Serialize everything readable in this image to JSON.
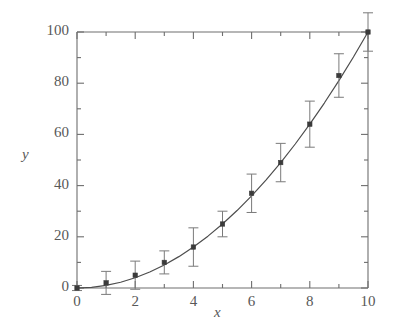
{
  "chart_data": {
    "type": "line",
    "title": "",
    "subtitle": "",
    "xlabel": "x",
    "ylabel": "y",
    "xlim": [
      0,
      10
    ],
    "ylim": [
      0,
      100
    ],
    "grid": false,
    "legend": null,
    "x_ticks": [
      0,
      2,
      4,
      6,
      8,
      10
    ],
    "x_tick_labels": [
      "0",
      "2",
      "4",
      "6",
      "8",
      "10"
    ],
    "x_minor_ticks": [
      1,
      3,
      5,
      7,
      9
    ],
    "y_ticks": [
      0,
      20,
      40,
      60,
      80,
      100
    ],
    "y_tick_labels": [
      "0",
      "20",
      "40",
      "60",
      "80",
      "100"
    ],
    "y_minor_ticks": [
      10,
      30,
      50,
      70,
      90
    ],
    "marker": "square",
    "line_style": "solid",
    "line_color": "#4d4d4d",
    "marker_color": "#3b3b3b",
    "errorbar_color": "#7a7a7a",
    "axis_color": "#6e6e6e",
    "series": [
      {
        "name": "y = x^2",
        "x": [
          0,
          1,
          2,
          3,
          4,
          5,
          6,
          7,
          8,
          9,
          10
        ],
        "values": [
          0,
          2,
          5,
          10,
          16,
          25,
          37,
          49,
          64,
          83,
          100
        ],
        "yerr": [
          1,
          4.5,
          5.5,
          4.5,
          7.5,
          5,
          7.5,
          7.5,
          9,
          8.5,
          7.5
        ]
      }
    ],
    "curve": {
      "description": "smooth quadratic fit through data points",
      "x": [
        0,
        0.5,
        1,
        1.5,
        2,
        2.5,
        3,
        3.5,
        4,
        4.5,
        5,
        5.5,
        6,
        6.5,
        7,
        7.5,
        8,
        8.5,
        9,
        9.5,
        10
      ],
      "values": [
        0,
        0.25,
        1,
        2.25,
        4,
        6.25,
        9,
        12.25,
        16,
        20.25,
        25,
        30.25,
        36,
        42.25,
        49,
        56.25,
        64,
        72.25,
        81,
        90.25,
        100
      ]
    }
  },
  "labels": {
    "y_axis_title": "y",
    "x_axis_title": "x"
  }
}
